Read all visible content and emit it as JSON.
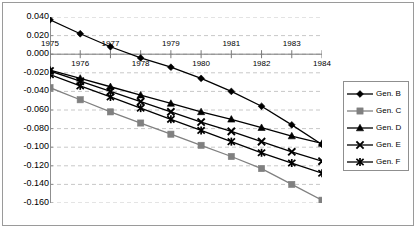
{
  "chart_data": {
    "type": "line",
    "title": "",
    "xlabel": "",
    "ylabel": "",
    "grid": true,
    "legend_position": "right",
    "x": [
      1975,
      1976,
      1977,
      1978,
      1979,
      1980,
      1981,
      1982,
      1983,
      1984
    ],
    "xlim": [
      1975,
      1984
    ],
    "ylim": [
      -0.16,
      0.04
    ],
    "ytick_labels": [
      "0.040",
      "0.020",
      "0.000",
      "-0.020",
      "-0.040",
      "-0.060",
      "-0.080",
      "-0.100",
      "-0.120",
      "-0.140",
      "-0.160"
    ],
    "ytick_values": [
      0.04,
      0.02,
      0.0,
      -0.02,
      -0.04,
      -0.06,
      -0.08,
      -0.1,
      -0.12,
      -0.14,
      -0.16
    ],
    "xtick_labels_upper": [
      "1975",
      "1977",
      "1979",
      "1981",
      "1983"
    ],
    "xtick_labels_lower": [
      "1976",
      "1978",
      "1980",
      "1982",
      "1984"
    ],
    "series": [
      {
        "name": "Gen. B",
        "marker": "diamond",
        "color": "#000000",
        "values": [
          0.037,
          0.022,
          0.008,
          -0.004,
          -0.014,
          -0.026,
          -0.04,
          -0.056,
          -0.076,
          -0.097
        ]
      },
      {
        "name": "Gen. C",
        "marker": "square",
        "color": "#808080",
        "values": [
          -0.036,
          -0.049,
          -0.062,
          -0.074,
          -0.086,
          -0.098,
          -0.11,
          -0.123,
          -0.14,
          -0.157
        ]
      },
      {
        "name": "Gen. D",
        "marker": "triangle",
        "color": "#000000",
        "values": [
          -0.017,
          -0.026,
          -0.035,
          -0.044,
          -0.053,
          -0.062,
          -0.07,
          -0.079,
          -0.088,
          -0.096
        ]
      },
      {
        "name": "Gen. E",
        "marker": "x",
        "color": "#000000",
        "values": [
          -0.018,
          -0.029,
          -0.04,
          -0.051,
          -0.062,
          -0.073,
          -0.083,
          -0.094,
          -0.105,
          -0.115
        ]
      },
      {
        "name": "Gen. F",
        "marker": "star",
        "color": "#000000",
        "values": [
          -0.022,
          -0.034,
          -0.046,
          -0.058,
          -0.07,
          -0.082,
          -0.094,
          -0.106,
          -0.117,
          -0.128
        ]
      }
    ]
  },
  "legend": {
    "items": [
      {
        "label": "Gen. B"
      },
      {
        "label": "Gen. C"
      },
      {
        "label": "Gen. D"
      },
      {
        "label": "Gen. E"
      },
      {
        "label": "Gen. F"
      }
    ]
  }
}
